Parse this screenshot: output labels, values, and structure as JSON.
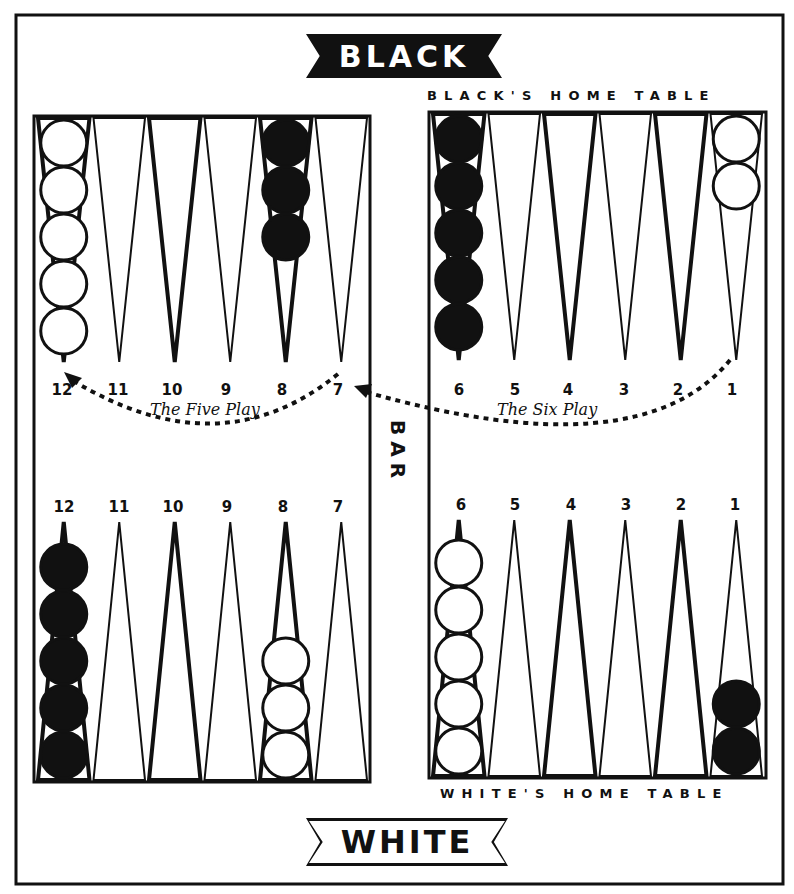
{
  "banners": {
    "top": "BLACK",
    "bottom": "WHITE"
  },
  "table_labels": {
    "black_home": "BLACK'S HOME TABLE",
    "white_home": "WHITE'S HOME TABLE"
  },
  "bar_label": "BAR",
  "plays": {
    "five": {
      "label": "The Five Play",
      "from_point": "1 (Black's home)",
      "to_point": "7 then 12"
    },
    "six": {
      "label": "The Six Play"
    }
  },
  "colors": {
    "ink": "#111111",
    "paper": "#ffffff",
    "black_checker": "#111111",
    "white_checker": "#ffffff"
  },
  "quadrants": {
    "top_left": {
      "labels": [
        "12",
        "11",
        "10",
        "9",
        "8",
        "7"
      ],
      "points": [
        {
          "point": "12",
          "checkers": 5,
          "color": "white"
        },
        {
          "point": "11",
          "checkers": 0,
          "color": null
        },
        {
          "point": "10",
          "checkers": 0,
          "color": null
        },
        {
          "point": "9",
          "checkers": 0,
          "color": null
        },
        {
          "point": "8",
          "checkers": 3,
          "color": "black"
        },
        {
          "point": "7",
          "checkers": 0,
          "color": null
        }
      ]
    },
    "top_right": {
      "labels": [
        "6",
        "5",
        "4",
        "3",
        "2",
        "1"
      ],
      "points": [
        {
          "point": "6",
          "checkers": 5,
          "color": "black"
        },
        {
          "point": "5",
          "checkers": 0,
          "color": null
        },
        {
          "point": "4",
          "checkers": 0,
          "color": null
        },
        {
          "point": "3",
          "checkers": 0,
          "color": null
        },
        {
          "point": "2",
          "checkers": 0,
          "color": null
        },
        {
          "point": "1",
          "checkers": 2,
          "color": "white"
        }
      ]
    },
    "bottom_left": {
      "labels": [
        "12",
        "11",
        "10",
        "9",
        "8",
        "7"
      ],
      "points": [
        {
          "point": "12",
          "checkers": 5,
          "color": "black"
        },
        {
          "point": "11",
          "checkers": 0,
          "color": null
        },
        {
          "point": "10",
          "checkers": 0,
          "color": null
        },
        {
          "point": "9",
          "checkers": 0,
          "color": null
        },
        {
          "point": "8",
          "checkers": 3,
          "color": "white"
        },
        {
          "point": "7",
          "checkers": 0,
          "color": null
        }
      ]
    },
    "bottom_right": {
      "labels": [
        "6",
        "5",
        "4",
        "3",
        "2",
        "1"
      ],
      "points": [
        {
          "point": "6",
          "checkers": 5,
          "color": "white"
        },
        {
          "point": "5",
          "checkers": 0,
          "color": null
        },
        {
          "point": "4",
          "checkers": 0,
          "color": null
        },
        {
          "point": "3",
          "checkers": 0,
          "color": null
        },
        {
          "point": "2",
          "checkers": 0,
          "color": null
        },
        {
          "point": "1",
          "checkers": 2,
          "color": "black"
        }
      ]
    }
  }
}
